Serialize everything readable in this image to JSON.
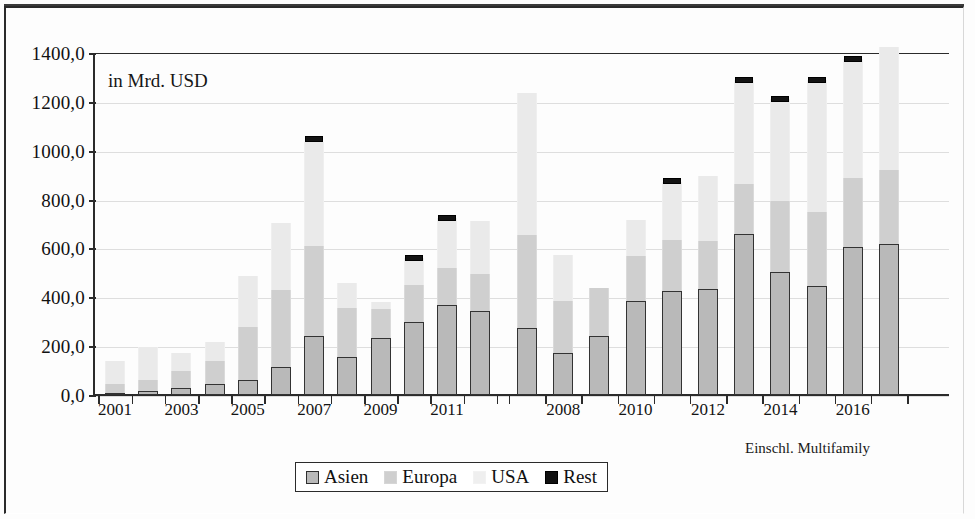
{
  "caption": "in Mrd. USD",
  "footnote": "Einschl. Multifamily",
  "legend": {
    "items": [
      {
        "label": "Asien",
        "color": "#b9b9b9",
        "icon": "square-swatch-icon"
      },
      {
        "label": "Europa",
        "color": "#cfcfcf",
        "icon": "square-swatch-icon"
      },
      {
        "label": "USA",
        "color": "#efefef",
        "icon": "square-swatch-icon"
      },
      {
        "label": "Rest",
        "color": "#111111",
        "icon": "square-swatch-icon"
      }
    ]
  },
  "chart_data": {
    "type": "bar",
    "stacked": true,
    "title": "in Mrd. USD",
    "xlabel": "",
    "ylabel": "in Mrd. USD",
    "ylim": [
      0,
      1400
    ],
    "ytick_labels": [
      "0,0",
      "200,0",
      "400,0",
      "600,0",
      "800,0",
      "1000,0",
      "1200,0",
      "1400,0"
    ],
    "ytick_values": [
      0,
      200,
      400,
      600,
      800,
      1000,
      1200,
      1400
    ],
    "grid": true,
    "legend_position": "bottom-center",
    "annotation": "Einschl. Multifamily",
    "series_names": [
      "Asien",
      "Europa",
      "USA",
      "Rest"
    ],
    "series_colors": [
      "#b9b9b9",
      "#cfcfcf",
      "#eaeaea",
      "#131313"
    ],
    "groups": [
      {
        "name": "left-group",
        "categories": [
          "2001",
          "2002",
          "2003",
          "2004",
          "2005",
          "2006",
          "2007",
          "2008",
          "2009",
          "2010",
          "2011",
          "2012"
        ],
        "tick_labels": [
          "2001",
          "",
          "2003",
          "",
          "2005",
          "",
          "2007",
          "",
          "2009",
          "",
          "2011",
          ""
        ],
        "series": [
          {
            "name": "Asien",
            "values": [
              10,
              18,
              28,
              45,
              62,
              115,
              240,
              155,
              232,
              297,
              370,
              342
            ]
          },
          {
            "name": "Europa",
            "values": [
              35,
              45,
              70,
              95,
              215,
              315,
              370,
              200,
              120,
              155,
              150,
              155
            ]
          },
          {
            "name": "USA",
            "values": [
              95,
              135,
              75,
              75,
              210,
              275,
              425,
              105,
              30,
              110,
              205,
              215
            ]
          },
          {
            "name": "Rest",
            "values": [
              0,
              0,
              0,
              0,
              0,
              0,
              1050,
              0,
              0,
              560,
              725,
              0
            ]
          }
        ],
        "totals": [
          140,
          198,
          173,
          215,
          487,
          705,
          1035,
          460,
          382,
          562,
          725,
          712
        ]
      },
      {
        "name": "right-group",
        "categories": [
          "2007",
          "2008",
          "2009",
          "2010",
          "2011",
          "2012",
          "2013",
          "2014",
          "2015",
          "2016",
          "2017"
        ],
        "tick_labels": [
          "",
          "2008",
          "",
          "2010",
          "",
          "2012",
          "",
          "2014",
          "",
          "2016",
          ""
        ],
        "series": [
          {
            "name": "Asien",
            "values": [
              275,
              172,
              240,
              385,
              425,
              435,
              660,
              505,
              445,
              605,
              618
            ]
          },
          {
            "name": "Europa",
            "values": [
              378,
              213,
              198,
              185,
              210,
              195,
              205,
              290,
              305,
              285,
              305
            ]
          },
          {
            "name": "USA",
            "values": [
              585,
              190,
              0,
              145,
              235,
              265,
              425,
              415,
              540,
              485,
              500
            ]
          },
          {
            "name": "Rest",
            "values": [
              0,
              0,
              0,
              0,
              875,
              0,
              1290,
              1212,
              1290,
              1375,
              0
            ]
          }
        ],
        "totals": [
          1238,
          575,
          438,
          715,
          870,
          895,
          1290,
          1210,
          1290,
          1375,
          1423
        ]
      }
    ]
  }
}
